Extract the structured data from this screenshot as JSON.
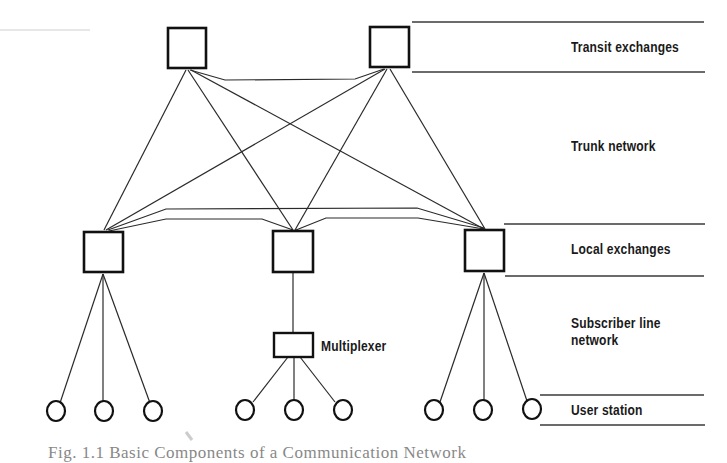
{
  "diagram": {
    "title": "Basic Components of a Communication Network",
    "caption": "Fig. 1.1  Basic Components of a Communication Network",
    "layers": [
      {
        "id": "transit",
        "label": "Transit exchanges"
      },
      {
        "id": "trunk",
        "label": "Trunk network"
      },
      {
        "id": "local",
        "label": "Local exchanges"
      },
      {
        "id": "subscriber",
        "label": "Subscriber line network"
      },
      {
        "id": "user",
        "label": "User station"
      }
    ],
    "labels": {
      "transit": "Transit exchanges",
      "trunk": "Trunk network",
      "local": "Local exchanges",
      "subscriber_line1": "Subscriber line",
      "subscriber_line2": "network",
      "user": "User station",
      "multiplexer": "Multiplexer"
    },
    "nodes": {
      "transit_exchanges": [
        {
          "id": "T1",
          "x": 168,
          "y": 28,
          "w": 38,
          "h": 40
        },
        {
          "id": "T2",
          "x": 370,
          "y": 27,
          "w": 39,
          "h": 40
        }
      ],
      "local_exchanges": [
        {
          "id": "L1",
          "x": 84,
          "y": 232,
          "w": 39,
          "h": 40
        },
        {
          "id": "L2",
          "x": 273,
          "y": 231,
          "w": 40,
          "h": 41
        },
        {
          "id": "L3",
          "x": 465,
          "y": 230,
          "w": 39,
          "h": 41
        }
      ],
      "multiplexer": {
        "id": "M1",
        "x": 274,
        "y": 333,
        "w": 39,
        "h": 24
      },
      "user_stations": [
        {
          "id": "U1",
          "cx": 56,
          "cy": 411
        },
        {
          "id": "U2",
          "cx": 104,
          "cy": 411
        },
        {
          "id": "U3",
          "cx": 153,
          "cy": 411
        },
        {
          "id": "U4",
          "cx": 245,
          "cy": 410
        },
        {
          "id": "U5",
          "cx": 294,
          "cy": 410
        },
        {
          "id": "U6",
          "cx": 343,
          "cy": 410
        },
        {
          "id": "U7",
          "cx": 434,
          "cy": 410
        },
        {
          "id": "U8",
          "cx": 483,
          "cy": 410
        },
        {
          "id": "U9",
          "cx": 532,
          "cy": 409
        }
      ]
    },
    "links": [
      {
        "from": "T1",
        "to": "T2",
        "type": "trunk"
      },
      {
        "from": "T1",
        "to": "L1",
        "type": "trunk"
      },
      {
        "from": "T1",
        "to": "L2",
        "type": "trunk"
      },
      {
        "from": "T1",
        "to": "L3",
        "type": "trunk"
      },
      {
        "from": "T2",
        "to": "L1",
        "type": "trunk"
      },
      {
        "from": "T2",
        "to": "L2",
        "type": "trunk"
      },
      {
        "from": "T2",
        "to": "L3",
        "type": "trunk"
      },
      {
        "from": "L1",
        "to": "L2",
        "type": "trunk"
      },
      {
        "from": "L1",
        "to": "L3",
        "type": "trunk"
      },
      {
        "from": "L2",
        "to": "L3",
        "type": "trunk"
      },
      {
        "from": "L1",
        "to": "U1",
        "type": "subscriber"
      },
      {
        "from": "L1",
        "to": "U2",
        "type": "subscriber"
      },
      {
        "from": "L1",
        "to": "U3",
        "type": "subscriber"
      },
      {
        "from": "L2",
        "to": "M1",
        "type": "subscriber"
      },
      {
        "from": "M1",
        "to": "U4",
        "type": "subscriber"
      },
      {
        "from": "M1",
        "to": "U5",
        "type": "subscriber"
      },
      {
        "from": "M1",
        "to": "U6",
        "type": "subscriber"
      },
      {
        "from": "L3",
        "to": "U7",
        "type": "subscriber"
      },
      {
        "from": "L3",
        "to": "U8",
        "type": "subscriber"
      },
      {
        "from": "L3",
        "to": "U9",
        "type": "subscriber"
      }
    ],
    "colors": {
      "ink": "#1a1a1a",
      "rule": "#3a3a3a",
      "background": "#ffffff"
    }
  }
}
